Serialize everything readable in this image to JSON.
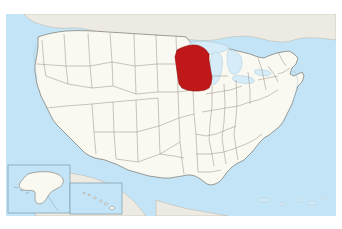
{
  "figure": {
    "kind": "locator-map",
    "width_px": 342,
    "height_px": 229,
    "caption": ""
  },
  "map": {
    "projection_note": "Contiguous United States with Alaska and Hawaii insets",
    "frame": {
      "x": 6,
      "y": 14,
      "width": 330,
      "height": 202
    },
    "highlighted_region": {
      "name": "Wisconsin",
      "abbr": "WI",
      "color": "#c01818"
    },
    "colors": {
      "ocean": "#c3e4f6",
      "land": "#f9f8f1",
      "land_outside": "#eceae2",
      "state_border": "#8a8276",
      "country_border": "#6f6a60",
      "coastline": "#9fb8c8",
      "highlight": "#c01818",
      "highlight_border": "#8d0f0f",
      "lake": "#d6ecf8",
      "inset_border": "#7d97a8",
      "page_background": "#ffffff"
    },
    "insets": [
      {
        "name": "Alaska",
        "label": "",
        "x": 8,
        "y": 165,
        "width": 62,
        "height": 48
      },
      {
        "name": "Hawaii",
        "label": "",
        "x": 70,
        "y": 183,
        "width": 52,
        "height": 31
      }
    ],
    "lakes": [
      {
        "name": "Lake Superior"
      },
      {
        "name": "Lake Michigan"
      },
      {
        "name": "Lake Huron"
      },
      {
        "name": "Lake Erie"
      },
      {
        "name": "Lake Ontario"
      }
    ],
    "legend": {
      "visible": false,
      "entries": []
    },
    "labels": {
      "visible": false,
      "items": []
    }
  }
}
